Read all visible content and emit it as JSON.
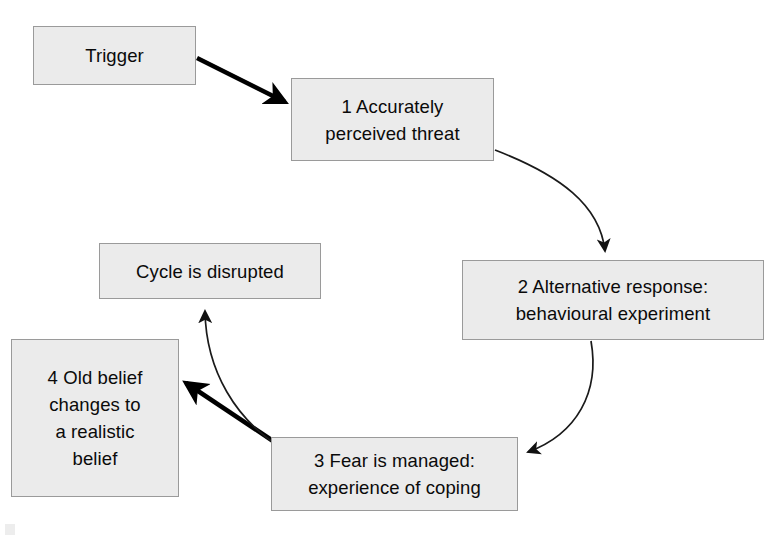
{
  "diagram": {
    "background_color": "#ffffff",
    "node_fill_color": "#ebebeb",
    "node_border_color": "#9a9a9a",
    "text_color": "#0a0a0a",
    "arrow_color": "#000000",
    "nodes": [
      {
        "id": "trigger",
        "label": "Trigger"
      },
      {
        "id": "step1",
        "label": "1 Accurately\nperceived threat"
      },
      {
        "id": "step2",
        "label": "2 Alternative response:\nbehavioural experiment"
      },
      {
        "id": "step3",
        "label": "3 Fear is managed:\nexperience of coping"
      },
      {
        "id": "step4",
        "label": "4 Old belief\nchanges to\na realistic\nbelief"
      },
      {
        "id": "cycle_disrupted",
        "label": "Cycle is disrupted"
      }
    ],
    "edges": [
      {
        "id": "trigger-to-step1",
        "from": "trigger",
        "to": "step1",
        "style": "thick-straight"
      },
      {
        "id": "step1-to-step2",
        "from": "step1",
        "to": "step2",
        "style": "thin-curved"
      },
      {
        "id": "step2-to-step3",
        "from": "step2",
        "to": "step3",
        "style": "thin-curved"
      },
      {
        "id": "step3-to-step4",
        "from": "step3",
        "to": "step4",
        "style": "thick-straight"
      },
      {
        "id": "step3-to-cycle-disrupted",
        "from": "step3",
        "to": "cycle_disrupted",
        "style": "thin-curved"
      }
    ]
  }
}
